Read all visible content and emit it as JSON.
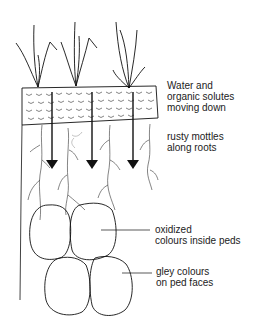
{
  "diagram": {
    "labels": {
      "water": [
        "Water and",
        "organic solutes",
        "moving down"
      ],
      "rusty": [
        "rusty mottles",
        "along roots"
      ],
      "oxidized": [
        "oxidized",
        "colours inside peds"
      ],
      "gley": [
        "gley colours",
        "on ped faces"
      ]
    }
  }
}
